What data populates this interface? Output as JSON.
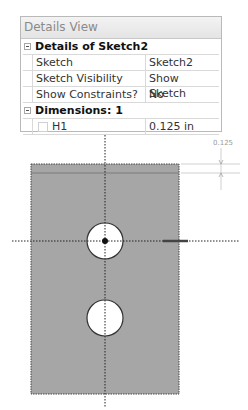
{
  "panel": {
    "title": "Details View",
    "groups": [
      {
        "label": "Details of Sketch2",
        "rows": [
          {
            "name": "Sketch",
            "value": "Sketch2"
          },
          {
            "name": "Sketch Visibility",
            "value": "Show Sketch"
          },
          {
            "name": "Show Constraints?",
            "value": "No"
          }
        ]
      },
      {
        "label": "Dimensions: 1",
        "rows": [
          {
            "name": "H1",
            "value": "0.125 in"
          }
        ]
      }
    ]
  },
  "sketch": {
    "dimension_label": "0.125",
    "plate_color": "#a6a6a6",
    "hole_color": "#ffffff"
  }
}
